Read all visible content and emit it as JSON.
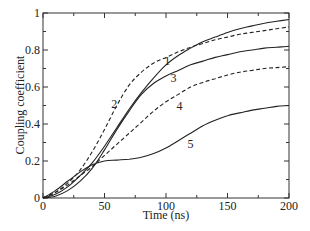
{
  "chart_data": {
    "type": "line",
    "title": "",
    "xlabel": "Time (ns)",
    "ylabel": "Coupling coefficient",
    "xlim": [
      0,
      200
    ],
    "ylim": [
      0,
      1
    ],
    "x_ticks": [
      0,
      50,
      100,
      150,
      200
    ],
    "x_tick_labels": [
      "0",
      "50",
      "100",
      "150",
      "200"
    ],
    "x_minor_ticks": [
      25,
      75,
      125,
      175
    ],
    "y_ticks": [
      0,
      0.2,
      0.4,
      0.6,
      0.8,
      1
    ],
    "y_tick_labels": [
      "0",
      "0.2",
      "0.4",
      "0.6",
      "0.8",
      "1"
    ],
    "grid": false,
    "legend": "none (inline curve labels)",
    "x": [
      0,
      10,
      20,
      30,
      40,
      50,
      60,
      70,
      80,
      90,
      100,
      110,
      120,
      130,
      140,
      150,
      160,
      170,
      180,
      190,
      200
    ],
    "series": [
      {
        "name": "1",
        "style": "solid",
        "label_pos": [
          101,
          0.74
        ],
        "values": [
          0,
          0.02,
          0.06,
          0.12,
          0.19,
          0.28,
          0.38,
          0.48,
          0.57,
          0.65,
          0.72,
          0.77,
          0.81,
          0.845,
          0.87,
          0.895,
          0.915,
          0.93,
          0.945,
          0.955,
          0.965
        ]
      },
      {
        "name": "2",
        "style": "dashed",
        "label_pos": [
          58,
          0.51
        ],
        "values": [
          0,
          0.03,
          0.08,
          0.15,
          0.25,
          0.37,
          0.5,
          0.61,
          0.68,
          0.73,
          0.76,
          0.79,
          0.815,
          0.835,
          0.855,
          0.87,
          0.885,
          0.895,
          0.905,
          0.915,
          0.925
        ]
      },
      {
        "name": "3",
        "style": "solid",
        "label_pos": [
          106,
          0.65
        ],
        "values": [
          0,
          0.01,
          0.04,
          0.09,
          0.16,
          0.26,
          0.37,
          0.47,
          0.56,
          0.62,
          0.66,
          0.69,
          0.72,
          0.74,
          0.76,
          0.775,
          0.79,
          0.8,
          0.81,
          0.815,
          0.82
        ]
      },
      {
        "name": "4",
        "style": "dashed",
        "label_pos": [
          111,
          0.5
        ],
        "values": [
          0,
          0.03,
          0.07,
          0.12,
          0.17,
          0.23,
          0.29,
          0.35,
          0.41,
          0.47,
          0.52,
          0.56,
          0.6,
          0.625,
          0.645,
          0.665,
          0.68,
          0.69,
          0.7,
          0.705,
          0.71
        ]
      },
      {
        "name": "5",
        "style": "solid",
        "label_pos": [
          120,
          0.29
        ],
        "values": [
          0,
          0.04,
          0.09,
          0.14,
          0.18,
          0.2,
          0.205,
          0.21,
          0.22,
          0.24,
          0.27,
          0.31,
          0.35,
          0.39,
          0.42,
          0.445,
          0.46,
          0.475,
          0.485,
          0.495,
          0.5
        ]
      }
    ]
  }
}
